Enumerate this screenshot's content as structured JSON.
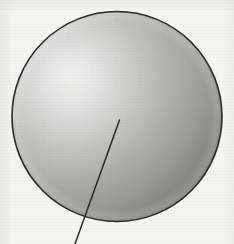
{
  "figure": {
    "caption": "",
    "canvas": {
      "width": 234,
      "height": 244
    },
    "background_color": "#f5f5f4"
  },
  "sphere": {
    "label": "sphere",
    "center_x": 117,
    "center_y": 116.5,
    "radius": 105,
    "outline_color": "#2b2b2b",
    "outline_width": 1.6,
    "highlight_x": 74,
    "highlight_y": 82,
    "highlight_color": "#e4e4e2",
    "midtone_color": "#b8b8b6",
    "shadow_color": "#818180",
    "rim_color": "#9a9a98"
  },
  "leader_line": {
    "label": "radius-leader-line",
    "x1": 119.5,
    "y1": 120,
    "x2": 75,
    "y2": 244,
    "color": "#262626",
    "width": 1.5
  },
  "annotations": {
    "items": []
  }
}
